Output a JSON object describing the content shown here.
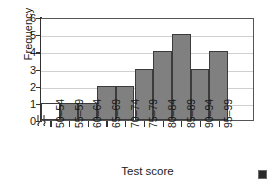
{
  "chart_data": {
    "type": "bar",
    "title": "",
    "subtitle": "",
    "xlabel": "Test score",
    "ylabel": "Frequency",
    "categories": [
      "50–54",
      "55–59",
      "60–64",
      "65–69",
      "70–74",
      "75–79",
      "80–84",
      "85–89",
      "90–94",
      "95–99"
    ],
    "values": [
      1,
      1,
      1,
      2,
      2,
      3,
      4,
      5,
      3,
      4
    ],
    "bar_fills": [
      "#ffffff",
      "#808080",
      "#808080",
      "#808080",
      "#808080",
      "#808080",
      "#808080",
      "#808080",
      "#808080",
      "#808080"
    ],
    "ylim": [
      0,
      6
    ],
    "y_ticks": [
      0,
      1,
      2,
      3,
      4,
      5,
      6
    ],
    "y_tick_labels": [
      "0",
      "1",
      "2",
      "3",
      "4",
      "5",
      "6"
    ],
    "grid": true,
    "grid_axis": "y",
    "legend": false,
    "legend_position": "none",
    "x_axis_break": true,
    "annotations": [],
    "colors": {
      "bar_fill": "#808080",
      "bar_first_fill": "#ffffff",
      "bar_edge": "#3b3b3b",
      "gridline": "#d0d0d0",
      "axis": "#333333",
      "plot_border": "#555555",
      "background": "#ffffff",
      "text": "#1a1a1a",
      "corner_marker": "#2a2a2a"
    }
  },
  "corner_marker": {
    "name": "corner-square-marker"
  }
}
